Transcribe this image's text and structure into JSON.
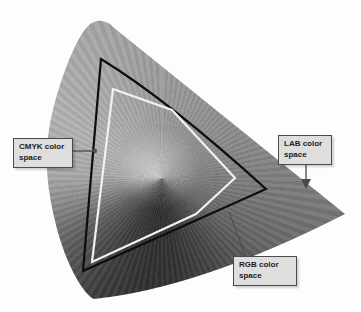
{
  "figure": {
    "labels": {
      "cmyk": "CMYK color space",
      "lab": "LAB color space",
      "rgb": "RGB color space"
    },
    "gamuts": [
      {
        "name": "LAB",
        "depiction": "large gray gradient horseshoe region"
      },
      {
        "name": "RGB",
        "depiction": "black outlined triangle"
      },
      {
        "name": "CMYK",
        "depiction": "white outlined polygon"
      }
    ],
    "colors": {
      "background": "#fdfdfd",
      "rgb_outline": "#0d0d0d",
      "cmyk_outline": "#f2f1ea",
      "label_box_bg": "#dedede",
      "label_box_border": "#4a4a4a",
      "leader_line": "#4a4a4a",
      "leader_dot": "#6b4a40"
    }
  }
}
